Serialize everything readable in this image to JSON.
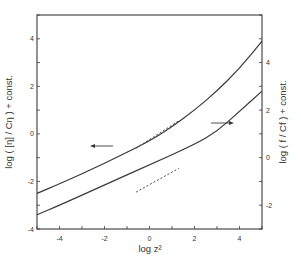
{
  "chart_data": {
    "type": "line",
    "title": "",
    "xlabel": "log z²",
    "ylabel_left": "log ( [η] / Cη ) + const.",
    "ylabel_right": "log ( f / Cf ) + const.",
    "xlim": [
      -5,
      5
    ],
    "ylim_left": [
      -4,
      5
    ],
    "ylim_right": [
      -3,
      6
    ],
    "x_ticks": [
      -4,
      -2,
      0,
      2,
      4
    ],
    "y_ticks_left": [
      -4,
      -2,
      0,
      2,
      4
    ],
    "y_ticks_right": [
      -2,
      0,
      2,
      4
    ],
    "grid": false,
    "legend": null,
    "series": [
      {
        "name": "log([η]/Cη) + const.",
        "axis": "left",
        "points": [
          [
            -5,
            -2.5
          ],
          [
            -4,
            -2.1
          ],
          [
            -2,
            -1.25
          ],
          [
            0,
            -0.3
          ],
          [
            1,
            0.3
          ],
          [
            2,
            1.0
          ],
          [
            3,
            1.8
          ],
          [
            4,
            2.75
          ],
          [
            5,
            3.9
          ]
        ],
        "asymptote_dashed": [
          [
            -0.6,
            -0.6
          ],
          [
            1.3,
            0.55
          ]
        ],
        "indicator_arrow": "left"
      },
      {
        "name": "log(f/Cf) + const.",
        "axis": "right",
        "points": [
          [
            -5,
            -2.4
          ],
          [
            -4,
            -2.0
          ],
          [
            -2,
            -1.15
          ],
          [
            0,
            -0.3
          ],
          [
            2,
            0.55
          ],
          [
            3,
            1.1
          ],
          [
            4,
            1.95
          ],
          [
            5,
            2.8
          ]
        ],
        "asymptote_dashed": [
          [
            -0.6,
            -1.45
          ],
          [
            1.3,
            -0.45
          ]
        ],
        "indicator_arrow": "right"
      }
    ]
  }
}
